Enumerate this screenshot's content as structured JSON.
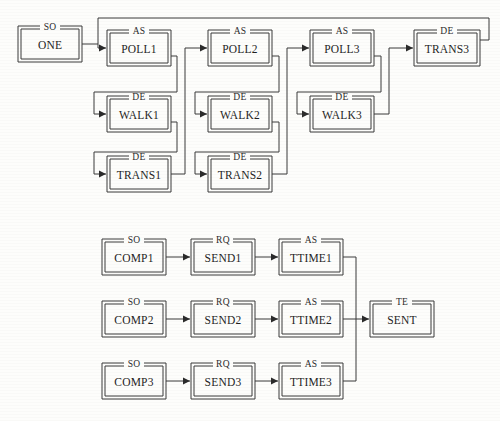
{
  "diagram": {
    "type": "state-transition-diagram",
    "background_color": "#fdfdfb",
    "line_color": "#3a3a3a",
    "text_color": "#1f1f1f",
    "width": 500,
    "height": 421,
    "groups": [
      {
        "id": "upper",
        "name": "polling-walking-transfer-pipeline",
        "nodes": [
          {
            "id": "one",
            "kind": "SO",
            "name": "ONE",
            "x": 18,
            "y": 26,
            "w": 64,
            "h": 36
          },
          {
            "id": "poll1",
            "kind": "AS",
            "name": "POLL1",
            "x": 107,
            "y": 30,
            "w": 64,
            "h": 36
          },
          {
            "id": "walk1",
            "kind": "DE",
            "name": "WALK1",
            "x": 107,
            "y": 96,
            "w": 64,
            "h": 36
          },
          {
            "id": "trans1",
            "kind": "DE",
            "name": "TRANS1",
            "x": 107,
            "y": 156,
            "w": 64,
            "h": 36
          },
          {
            "id": "poll2",
            "kind": "AS",
            "name": "POLL2",
            "x": 208,
            "y": 30,
            "w": 64,
            "h": 36
          },
          {
            "id": "walk2",
            "kind": "DE",
            "name": "WALK2",
            "x": 208,
            "y": 96,
            "w": 64,
            "h": 36
          },
          {
            "id": "trans2",
            "kind": "DE",
            "name": "TRANS2",
            "x": 208,
            "y": 156,
            "w": 64,
            "h": 36
          },
          {
            "id": "poll3",
            "kind": "AS",
            "name": "POLL3",
            "x": 310,
            "y": 30,
            "w": 64,
            "h": 36
          },
          {
            "id": "walk3",
            "kind": "DE",
            "name": "WALK3",
            "x": 310,
            "y": 96,
            "w": 64,
            "h": 36
          },
          {
            "id": "trans3",
            "kind": "DE",
            "name": "TRANS3",
            "x": 414,
            "y": 30,
            "w": 66,
            "h": 36
          }
        ],
        "edges": [
          {
            "id": "e-one-poll1",
            "from": "one",
            "to": "poll1"
          },
          {
            "id": "e-poll1-poll2",
            "from": "poll1",
            "to": "poll2"
          },
          {
            "id": "e-poll1-walk1",
            "from": "poll1",
            "to": "walk1"
          },
          {
            "id": "e-poll1-trans1",
            "from": "poll1",
            "to": "trans1"
          },
          {
            "id": "e-walk1-poll2",
            "from": "walk1",
            "to": "poll2"
          },
          {
            "id": "e-trans1-poll2",
            "from": "trans1",
            "to": "poll2"
          },
          {
            "id": "e-poll2-walk2",
            "from": "poll2",
            "to": "walk2"
          },
          {
            "id": "e-poll2-trans2",
            "from": "poll2",
            "to": "trans2"
          },
          {
            "id": "e-poll2-poll3",
            "from": "poll2",
            "to": "poll3"
          },
          {
            "id": "e-walk2-poll3",
            "from": "walk2",
            "to": "poll3"
          },
          {
            "id": "e-trans2-poll3",
            "from": "trans2",
            "to": "poll3"
          },
          {
            "id": "e-poll3-walk3",
            "from": "poll3",
            "to": "walk3"
          },
          {
            "id": "e-poll3-trans3",
            "from": "poll3",
            "to": "trans3"
          },
          {
            "id": "e-walk3-trans3",
            "from": "walk3",
            "to": "trans3"
          },
          {
            "id": "e-trans3-feedback",
            "from": "trans3",
            "to": "poll1",
            "style": "feedback-loop"
          }
        ]
      },
      {
        "id": "lower",
        "name": "compose-send-transmit-pipeline",
        "nodes": [
          {
            "id": "comp1",
            "kind": "SO",
            "name": "COMP1",
            "x": 102,
            "y": 239,
            "w": 64,
            "h": 36
          },
          {
            "id": "send1",
            "kind": "RQ",
            "name": "SEND1",
            "x": 191,
            "y": 239,
            "w": 64,
            "h": 36
          },
          {
            "id": "ttime1",
            "kind": "AS",
            "name": "TTIME1",
            "x": 279,
            "y": 239,
            "w": 64,
            "h": 36
          },
          {
            "id": "comp2",
            "kind": "SO",
            "name": "COMP2",
            "x": 102,
            "y": 301,
            "w": 64,
            "h": 36
          },
          {
            "id": "send2",
            "kind": "RQ",
            "name": "SEND2",
            "x": 191,
            "y": 301,
            "w": 64,
            "h": 36
          },
          {
            "id": "ttime2",
            "kind": "AS",
            "name": "TTIME2",
            "x": 279,
            "y": 301,
            "w": 64,
            "h": 36
          },
          {
            "id": "sent",
            "kind": "TE",
            "name": "SENT",
            "x": 370,
            "y": 301,
            "w": 64,
            "h": 36
          },
          {
            "id": "comp3",
            "kind": "SO",
            "name": "COMP3",
            "x": 102,
            "y": 363,
            "w": 64,
            "h": 36
          },
          {
            "id": "send3",
            "kind": "RQ",
            "name": "SEND3",
            "x": 191,
            "y": 363,
            "w": 64,
            "h": 36
          },
          {
            "id": "ttime3",
            "kind": "AS",
            "name": "TTIME3",
            "x": 279,
            "y": 363,
            "w": 64,
            "h": 36
          }
        ],
        "edges": [
          {
            "id": "e-comp1-send1",
            "from": "comp1",
            "to": "send1"
          },
          {
            "id": "e-send1-ttime1",
            "from": "send1",
            "to": "ttime1"
          },
          {
            "id": "e-ttime1-sent",
            "from": "ttime1",
            "to": "sent"
          },
          {
            "id": "e-comp2-send2",
            "from": "comp2",
            "to": "send2"
          },
          {
            "id": "e-send2-ttime2",
            "from": "send2",
            "to": "ttime2"
          },
          {
            "id": "e-ttime2-sent",
            "from": "ttime2",
            "to": "sent"
          },
          {
            "id": "e-comp3-send3",
            "from": "comp3",
            "to": "send3"
          },
          {
            "id": "e-send3-ttime3",
            "from": "send3",
            "to": "ttime3"
          },
          {
            "id": "e-ttime3-sent",
            "from": "ttime3",
            "to": "sent"
          }
        ]
      }
    ]
  }
}
